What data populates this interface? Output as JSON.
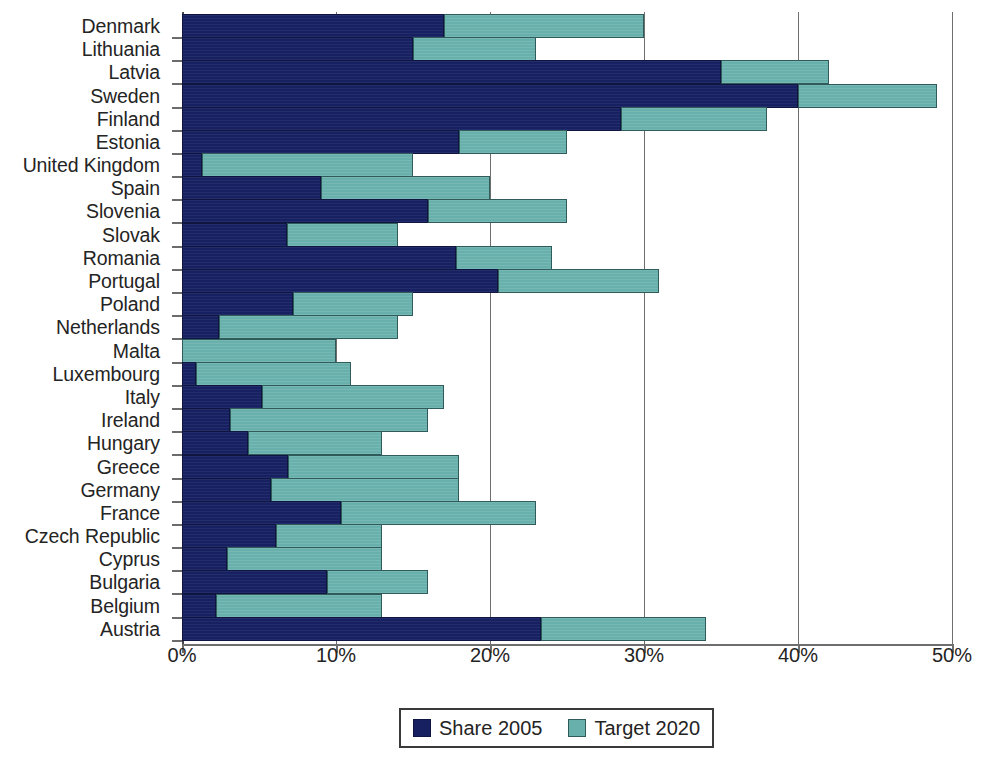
{
  "chart_data": {
    "type": "bar",
    "orientation": "horizontal",
    "stacked": false,
    "title": "",
    "xlabel": "",
    "ylabel": "",
    "xlim": [
      0,
      50
    ],
    "xticks": [
      0,
      10,
      20,
      30,
      40,
      50
    ],
    "xtick_labels": [
      "0%",
      "10%",
      "20%",
      "30%",
      "40%",
      "50%"
    ],
    "grid": true,
    "grid_axis": "x",
    "legend_position": "bottom",
    "categories": [
      "Denmark",
      "Lithuania",
      "Latvia",
      "Sweden",
      "Finland",
      "Estonia",
      "United Kingdom",
      "Spain",
      "Slovenia",
      "Slovak",
      "Romania",
      "Portugal",
      "Poland",
      "Netherlands",
      "Malta",
      "Luxembourg",
      "Italy",
      "Ireland",
      "Hungary",
      "Greece",
      "Germany",
      "France",
      "Czech Republic",
      "Cyprus",
      "Bulgaria",
      "Belgium",
      "Austria"
    ],
    "series": [
      {
        "name": "Share 2005",
        "color": "#172162",
        "values": [
          17,
          15,
          35,
          40,
          28.5,
          18,
          1.3,
          9,
          16,
          6.8,
          17.8,
          20.5,
          7.2,
          2.4,
          0,
          0.9,
          5.2,
          3.1,
          4.3,
          6.9,
          5.8,
          10.3,
          6.1,
          2.9,
          9.4,
          2.2,
          23.3
        ]
      },
      {
        "name": "Target 2020",
        "color": "#68b0ac",
        "values": [
          30,
          23,
          42,
          49,
          38,
          25,
          15,
          20,
          25,
          14,
          24,
          31,
          15,
          14,
          10,
          11,
          17,
          16,
          13,
          18,
          18,
          23,
          13,
          13,
          16,
          13,
          34
        ]
      }
    ]
  },
  "legend": {
    "items": [
      {
        "label": "Share 2005",
        "swatch": "share"
      },
      {
        "label": "Target 2020",
        "swatch": "target"
      }
    ]
  }
}
